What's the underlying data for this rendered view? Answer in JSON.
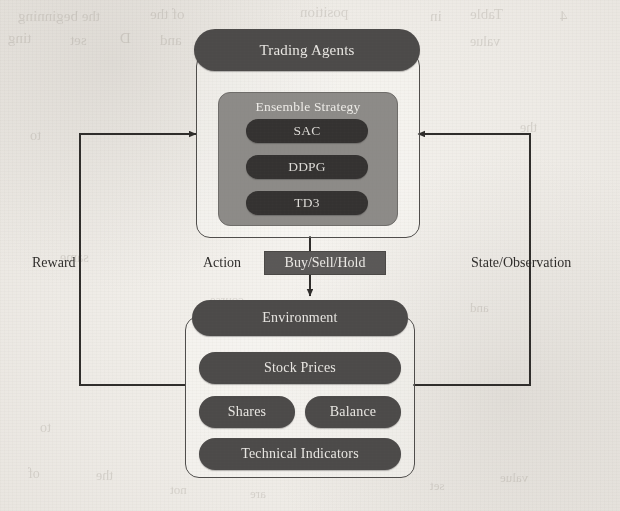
{
  "figure": {
    "type": "architecture-diagram",
    "background": "#efece7",
    "ink_color": "#2f2d2b",
    "node_fill": "#4c4a49",
    "node_fill_dark": "#343231",
    "subpanel_fill": "#8d8b88"
  },
  "agent_block": {
    "title": "Trading Agents",
    "ensemble": {
      "title": "Ensemble Strategy",
      "algorithms": [
        {
          "label": "SAC"
        },
        {
          "label": "DDPG"
        },
        {
          "label": "TD3"
        }
      ]
    }
  },
  "action_flow": {
    "label": "Action",
    "box_label": "Buy/Sell/Hold"
  },
  "environment_block": {
    "title": "Environment",
    "components": [
      {
        "label": "Stock Prices"
      },
      {
        "label": "Shares"
      },
      {
        "label": "Balance"
      },
      {
        "label": "Technical Indicators"
      }
    ]
  },
  "feedback": {
    "left_label": "Reward",
    "right_label": "State/Observation"
  },
  "bleed_through": [
    {
      "text": "the beginning",
      "x": 18,
      "y": 8,
      "size": 15
    },
    {
      "text": "of the",
      "x": 150,
      "y": 6,
      "size": 15
    },
    {
      "text": "position",
      "x": 300,
      "y": 4,
      "size": 15
    },
    {
      "text": "in",
      "x": 430,
      "y": 8,
      "size": 15
    },
    {
      "text": "Table",
      "x": 470,
      "y": 6,
      "size": 15
    },
    {
      "text": "4",
      "x": 560,
      "y": 8,
      "size": 15
    },
    {
      "text": "ting",
      "x": 8,
      "y": 30,
      "size": 15
    },
    {
      "text": "set",
      "x": 70,
      "y": 32,
      "size": 15
    },
    {
      "text": "D",
      "x": 120,
      "y": 30,
      "size": 15
    },
    {
      "text": "and",
      "x": 160,
      "y": 32,
      "size": 15
    },
    {
      "text": "value",
      "x": 470,
      "y": 34,
      "size": 14
    },
    {
      "text": "to",
      "x": 30,
      "y": 128,
      "size": 14
    },
    {
      "text": "the",
      "x": 520,
      "y": 120,
      "size": 14
    },
    {
      "text": "same",
      "x": 60,
      "y": 250,
      "size": 14
    },
    {
      "text": "course",
      "x": 210,
      "y": 292,
      "size": 13
    },
    {
      "text": "and",
      "x": 470,
      "y": 300,
      "size": 13
    },
    {
      "text": "to",
      "x": 40,
      "y": 420,
      "size": 14
    },
    {
      "text": "of",
      "x": 28,
      "y": 466,
      "size": 14
    },
    {
      "text": "the",
      "x": 96,
      "y": 468,
      "size": 14
    },
    {
      "text": "not",
      "x": 170,
      "y": 482,
      "size": 13
    },
    {
      "text": "are",
      "x": 250,
      "y": 486,
      "size": 13
    },
    {
      "text": "set",
      "x": 430,
      "y": 478,
      "size": 13
    },
    {
      "text": "value",
      "x": 500,
      "y": 470,
      "size": 13
    }
  ]
}
